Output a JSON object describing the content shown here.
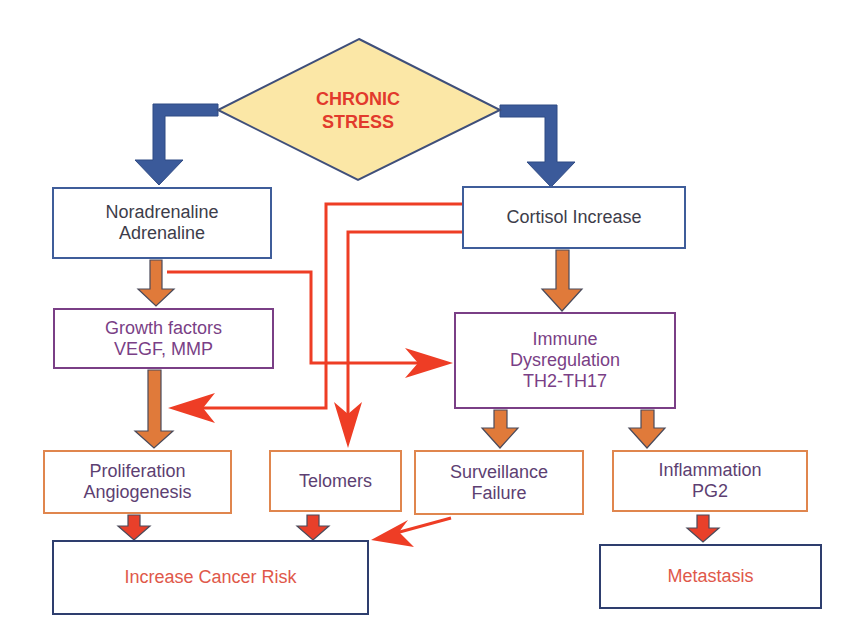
{
  "diagram": {
    "type": "flowchart",
    "root": {
      "id": "chronic-stress",
      "label": "CHRONIC\nSTRESS",
      "shape": "diamond",
      "fill": "#fbe7a6",
      "text_color": "#e23a2c"
    },
    "nodes": [
      {
        "id": "noradrenaline",
        "label": "Noradrenaline\nAdrenaline",
        "border": "#3f5d9a"
      },
      {
        "id": "cortisol",
        "label": "Cortisol Increase",
        "border": "#3f5d9a"
      },
      {
        "id": "growth-factors",
        "label": "Growth factors\nVEGF, MMP",
        "border": "#7a3f86"
      },
      {
        "id": "immune",
        "label": "Immune\nDysregulation\nTH2-TH17",
        "border": "#7a3f86"
      },
      {
        "id": "proliferation",
        "label": "Proliferation\nAngiogenesis",
        "border": "#e0864e"
      },
      {
        "id": "telomers",
        "label": "Telomers",
        "border": "#e0864e"
      },
      {
        "id": "surveillance",
        "label": "Surveillance\nFailure",
        "border": "#e0864e"
      },
      {
        "id": "inflammation",
        "label": "Inflammation\nPG2",
        "border": "#e0864e"
      },
      {
        "id": "cancer-risk",
        "label": "Increase Cancer Risk",
        "border": "#2e3e6e"
      },
      {
        "id": "metastasis",
        "label": "Metastasis",
        "border": "#2e3e6e"
      }
    ],
    "edges": [
      {
        "from": "chronic-stress",
        "to": "noradrenaline",
        "style": "thick-blue"
      },
      {
        "from": "chronic-stress",
        "to": "cortisol",
        "style": "thick-blue"
      },
      {
        "from": "noradrenaline",
        "to": "growth-factors",
        "style": "thick-orange"
      },
      {
        "from": "noradrenaline",
        "to": "immune",
        "style": "thin-red"
      },
      {
        "from": "cortisol",
        "to": "immune",
        "style": "thick-orange"
      },
      {
        "from": "cortisol",
        "to": "proliferation",
        "style": "thin-red"
      },
      {
        "from": "cortisol",
        "to": "telomers",
        "style": "thin-red"
      },
      {
        "from": "growth-factors",
        "to": "proliferation",
        "style": "thick-orange"
      },
      {
        "from": "immune",
        "to": "surveillance",
        "style": "thick-orange"
      },
      {
        "from": "immune",
        "to": "inflammation",
        "style": "thick-orange"
      },
      {
        "from": "proliferation",
        "to": "cancer-risk",
        "style": "thick-red"
      },
      {
        "from": "telomers",
        "to": "cancer-risk",
        "style": "thick-red"
      },
      {
        "from": "surveillance",
        "to": "cancer-risk",
        "style": "thin-red"
      },
      {
        "from": "inflammation",
        "to": "metastasis",
        "style": "thick-red"
      }
    ]
  },
  "colors": {
    "blue_arrow": "#3b5a9a",
    "orange_arrow": "#e07a3a",
    "red_line": "#ee3d25",
    "arrow_outline": "#4a4a5a",
    "diamond_fill": "#fbe7a6",
    "diamond_border": "#3f4f7a"
  }
}
